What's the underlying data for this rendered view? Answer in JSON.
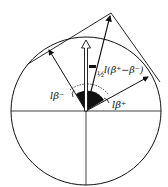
{
  "diagram": {
    "labels": {
      "beta_minus": "lβ⁻",
      "beta_plus": "lβ⁺",
      "half_frac": "½",
      "half_diff": "l(β⁺−β⁻)"
    },
    "colors": {
      "ink": "#111111",
      "background": "#ffffff"
    },
    "geometry": {
      "circle_center": [
        86,
        111
      ],
      "circle_radius": 74,
      "apex": [
        111,
        13
      ]
    }
  }
}
